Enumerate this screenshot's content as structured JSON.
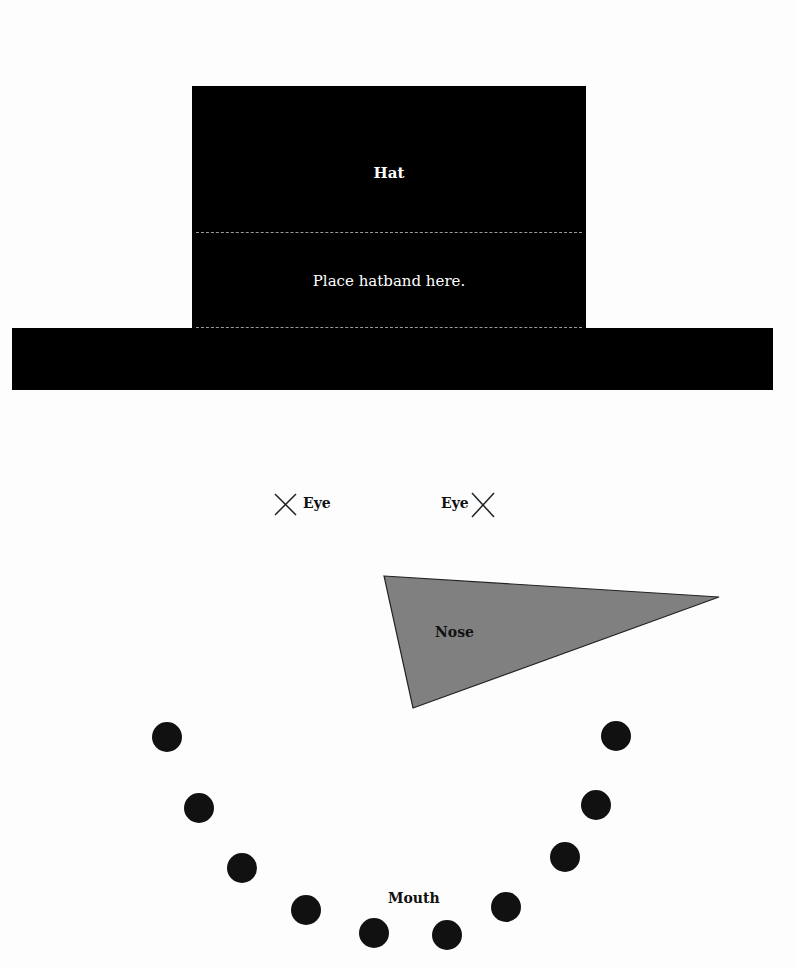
{
  "hat": {
    "title": "Hat",
    "band_label": "Place hatband here."
  },
  "eyes": {
    "left_label": "Eye",
    "right_label": "Eye",
    "marker_icon": "x-mark"
  },
  "nose": {
    "label": "Nose",
    "fill": "#808080",
    "points": [
      [
        384,
        576
      ],
      [
        719,
        597
      ],
      [
        413,
        708
      ]
    ]
  },
  "mouth": {
    "label": "Mouth",
    "dot_color": "#111111",
    "dots": [
      [
        167,
        737
      ],
      [
        199,
        808
      ],
      [
        242,
        868
      ],
      [
        306,
        910
      ],
      [
        374,
        933
      ],
      [
        447,
        935
      ],
      [
        506,
        907
      ],
      [
        565,
        857
      ],
      [
        596,
        805
      ],
      [
        616,
        736
      ]
    ]
  },
  "colors": {
    "background": "#fdfdfd",
    "hat": "#000000",
    "dashes": "#9a9a9a"
  }
}
